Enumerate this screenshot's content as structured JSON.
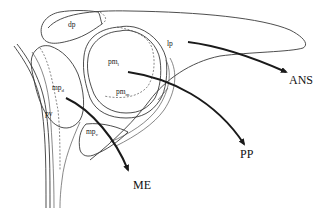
{
  "diagram": {
    "regions": {
      "dp": {
        "label": "dp"
      },
      "lp": {
        "label": "lp"
      },
      "pm_l": {
        "label": "pm",
        "sub": "l"
      },
      "pm_m": {
        "label": "pm",
        "sub": "m"
      },
      "mp_d": {
        "label": "mp",
        "sub": "d"
      },
      "mp_v": {
        "label": "mp",
        "sub": "v"
      },
      "pv": {
        "label": "pv"
      }
    },
    "targets": {
      "ans": {
        "label": "ANS"
      },
      "pp": {
        "label": "PP"
      },
      "me": {
        "label": "ME"
      }
    },
    "colors": {
      "line": "#3a3a3a",
      "arrow": "#1a1a1a",
      "background": "#ffffff"
    }
  }
}
